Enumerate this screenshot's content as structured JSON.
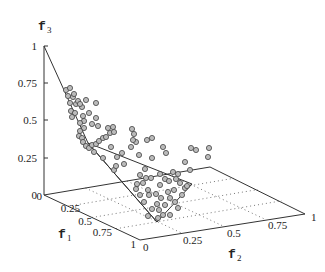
{
  "chart_data": {
    "type": "scatter",
    "subtype": "3d-scatter-with-surface",
    "title": "",
    "axes": {
      "x": {
        "label": "f",
        "subscript": "1",
        "ticks": [
          "0",
          "0.25",
          "0.5",
          "0.75",
          "1"
        ],
        "range": [
          0,
          1
        ]
      },
      "y": {
        "label": "f",
        "subscript": "2",
        "ticks": [
          "0",
          "0.25",
          "0.5",
          "0.75",
          "1"
        ],
        "range": [
          0,
          1
        ]
      },
      "z": {
        "label": "f",
        "subscript": "3",
        "ticks": [
          "0",
          "0.25",
          "0.5",
          "0.75",
          "1"
        ],
        "range": [
          0,
          1
        ]
      }
    },
    "grid": "dotted on base plane",
    "legend": null,
    "surface_outline": {
      "description": "Piecewise-linear Pareto front reference surface",
      "vertices_px": [
        [
          44,
          46
        ],
        [
          88,
          143
        ],
        [
          157,
          222
        ],
        [
          192,
          184
        ],
        [
          88,
          143
        ]
      ]
    },
    "points_px": [
      [
        66,
        90
      ],
      [
        70,
        88
      ],
      [
        68,
        96
      ],
      [
        73,
        97
      ],
      [
        74,
        94
      ],
      [
        70,
        103
      ],
      [
        76,
        104
      ],
      [
        78,
        101
      ],
      [
        86,
        100
      ],
      [
        82,
        107
      ],
      [
        71,
        111
      ],
      [
        75,
        113
      ],
      [
        72,
        117
      ],
      [
        80,
        104
      ],
      [
        83,
        116
      ],
      [
        84,
        121
      ],
      [
        80,
        123
      ],
      [
        84,
        128
      ],
      [
        80,
        131
      ],
      [
        79,
        136
      ],
      [
        82,
        138
      ],
      [
        89,
        113
      ],
      [
        96,
        103
      ],
      [
        96,
        118
      ],
      [
        92,
        124
      ],
      [
        98,
        126
      ],
      [
        83,
        142
      ],
      [
        86,
        146
      ],
      [
        89,
        148
      ],
      [
        92,
        145
      ],
      [
        96,
        144
      ],
      [
        99,
        141
      ],
      [
        103,
        138
      ],
      [
        106,
        137
      ],
      [
        110,
        133
      ],
      [
        114,
        132
      ],
      [
        113,
        127
      ],
      [
        108,
        128
      ],
      [
        94,
        152
      ],
      [
        103,
        158
      ],
      [
        111,
        147
      ],
      [
        114,
        170
      ],
      [
        116,
        166
      ],
      [
        117,
        157
      ],
      [
        122,
        153
      ],
      [
        124,
        164
      ],
      [
        131,
        147
      ],
      [
        136,
        142
      ],
      [
        133,
        140
      ],
      [
        139,
        155
      ],
      [
        147,
        140
      ],
      [
        152,
        138
      ],
      [
        152,
        158
      ],
      [
        145,
        169
      ],
      [
        140,
        175
      ],
      [
        146,
        178
      ],
      [
        143,
        183
      ],
      [
        137,
        184
      ],
      [
        148,
        190
      ],
      [
        149,
        195
      ],
      [
        136,
        189
      ],
      [
        140,
        195
      ],
      [
        151,
        178
      ],
      [
        160,
        185
      ],
      [
        165,
        179
      ],
      [
        160,
        174
      ],
      [
        169,
        181
      ],
      [
        173,
        172
      ],
      [
        176,
        179
      ],
      [
        180,
        183
      ],
      [
        178,
        174
      ],
      [
        185,
        188
      ],
      [
        187,
        186
      ],
      [
        174,
        190
      ],
      [
        182,
        195
      ],
      [
        168,
        192
      ],
      [
        161,
        198
      ],
      [
        157,
        204
      ],
      [
        152,
        209
      ],
      [
        159,
        210
      ],
      [
        165,
        205
      ],
      [
        170,
        198
      ],
      [
        175,
        202
      ],
      [
        178,
        208
      ],
      [
        163,
        215
      ],
      [
        170,
        215
      ],
      [
        158,
        218
      ],
      [
        148,
        216
      ],
      [
        144,
        202
      ],
      [
        156,
        194
      ],
      [
        190,
        170
      ],
      [
        185,
        162
      ],
      [
        196,
        150
      ],
      [
        132,
        129
      ],
      [
        134,
        134
      ],
      [
        209,
        148
      ],
      [
        208,
        157
      ],
      [
        191,
        148
      ],
      [
        163,
        147
      ],
      [
        166,
        153
      ]
    ]
  },
  "labels": {
    "f3": {
      "base": "f",
      "sub": "3"
    },
    "f1": {
      "base": "f",
      "sub": "1"
    },
    "f2": {
      "base": "f",
      "sub": "2"
    },
    "z_ticks": [
      "1",
      "0.75",
      "0.5",
      "0.25",
      "0"
    ],
    "x_ticks": [
      "0",
      "0.25",
      "0.5",
      "0.75",
      "1"
    ],
    "y_ticks": [
      "0",
      "0.25",
      "0.5",
      "0.75",
      "1"
    ]
  }
}
